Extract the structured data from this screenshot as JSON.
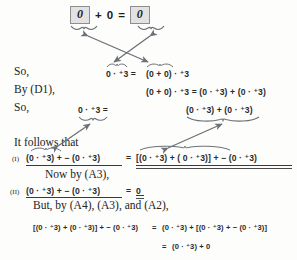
{
  "page": {
    "kind": "textbook-proof-page",
    "background_color": "#fdfdfc",
    "ink_color": "#232323",
    "annotation_color": "#6b6f76",
    "box_fill": "#e2e2e2",
    "box_border": "#8e8e8e"
  },
  "top_equation": {
    "boxed_left": "0",
    "operator_plus": "+",
    "addend": "0",
    "equals": "=",
    "boxed_right": "0"
  },
  "lines": [
    {
      "id": "line-so-1",
      "label": "So,",
      "math": "0 · ⁺3 =  (0 + 0) · ⁺3",
      "parts": {
        "lhs": "0 · ⁺3 =",
        "rhs": "(0 + 0) · ⁺3"
      }
    },
    {
      "id": "line-by-d1",
      "label": "By (D1),",
      "math": "(0 + 0) · ⁺3 = (0 · ⁺3) + (0 · ⁺3)"
    },
    {
      "id": "line-so-2",
      "label": "So,",
      "parts": {
        "lhs": "0 · ⁺3 =",
        "rhs": "(0 · ⁺3) + (0 · ⁺3)"
      }
    },
    {
      "id": "line-it-follows",
      "label": "It follows that"
    },
    {
      "id": "line-I",
      "tag": "(I)",
      "lhs": "(0 · ⁺3) + − (0 · ⁺3)",
      "equals": "=",
      "rhs": "[(0 · ⁺3) + ( 0 · ⁺3)] + − (0 · ⁺3)"
    },
    {
      "id": "line-now-by-a3",
      "label": "Now by (A3),"
    },
    {
      "id": "line-II",
      "tag": "(II)",
      "lhs": "(0 · ⁺3) + − (0 · ⁺3)",
      "equals": "=",
      "rhs": "0"
    },
    {
      "id": "line-but-by",
      "label": "But, by (A4), (A3), and (A2),"
    },
    {
      "id": "line-chain-1",
      "lhs": "[(0 · ⁺3) + (0 · ⁺3)] + − (0 · ⁺3)",
      "equals": "=",
      "rhs": "(0 · ⁺3) + [(0 · ⁺3) + − (0 · ⁺3)]"
    },
    {
      "id": "line-chain-2",
      "equals": "=",
      "rhs": "(0 · ⁺3) + 0"
    }
  ],
  "annotations": {
    "arrows": [
      {
        "name": "arrow-cross-left-down",
        "desc": "from boxed left 0 brace down-right to (0 + 0) brace"
      },
      {
        "name": "arrow-cross-right-down",
        "desc": "from boxed right 0 brace down-left to 0 brace"
      },
      {
        "name": "arrow-lower-left",
        "desc": "double headed, from line-I lhs brace up-right to line-so-2 lhs brace"
      },
      {
        "name": "arrow-lower-right",
        "desc": "double headed, from line-I rhs brace up-right to line-so-2 rhs brace"
      }
    ],
    "braces": [
      {
        "name": "brace-under-boxed-left"
      },
      {
        "name": "brace-under-boxed-right"
      },
      {
        "name": "brace-over-so1-lhs"
      },
      {
        "name": "brace-over-so1-rhs"
      },
      {
        "name": "brace-under-so2-lhs"
      },
      {
        "name": "brace-under-so2-rhs"
      },
      {
        "name": "brace-over-lineI-lhs"
      },
      {
        "name": "brace-over-lineI-rhs"
      }
    ]
  }
}
